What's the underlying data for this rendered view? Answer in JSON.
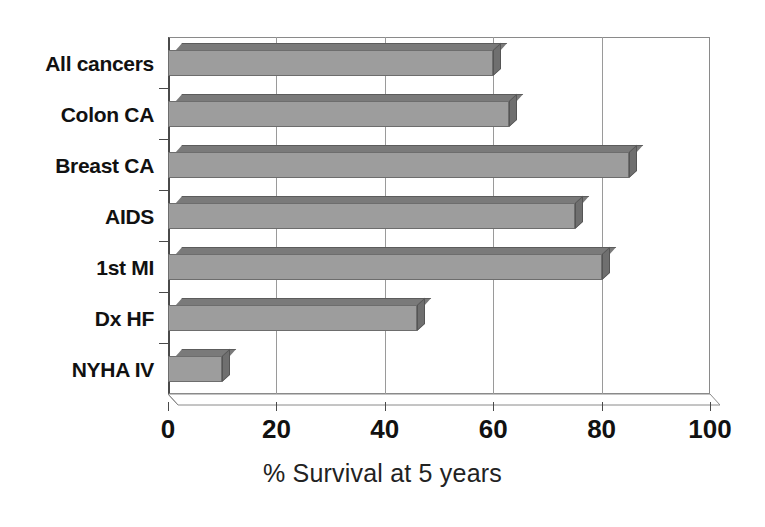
{
  "chart_data": {
    "type": "bar",
    "orientation": "horizontal",
    "title": "",
    "xlabel": "% Survival at 5 years",
    "ylabel": "",
    "xlim": [
      0,
      100
    ],
    "xticks": [
      0,
      20,
      40,
      60,
      80,
      100
    ],
    "xtick_labels": [
      "0",
      "20",
      "40",
      "60",
      "80",
      "100"
    ],
    "grid": true,
    "grid_axis": "x",
    "legend": false,
    "style": "3d-bar",
    "bar_color": "#9d9d9d",
    "bar_edge_color": "#6d6d6d",
    "categories": [
      "All cancers",
      "Colon CA",
      "Breast CA",
      "AIDS",
      "1st MI",
      "Dx HF",
      "NYHA IV"
    ],
    "values": [
      60,
      63,
      85,
      75,
      80,
      46,
      10
    ],
    "series": [
      {
        "name": "% Survival at 5 years",
        "values": [
          60,
          63,
          85,
          75,
          80,
          46,
          10
        ]
      }
    ]
  }
}
